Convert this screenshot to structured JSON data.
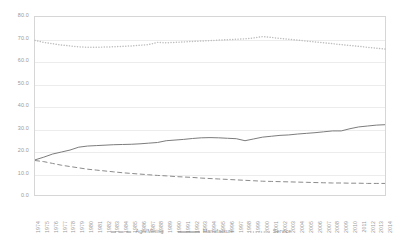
{
  "chart_data": {
    "type": "line",
    "title": "",
    "subtitle": "",
    "xlabel": "",
    "ylabel": "",
    "ylim": [
      0,
      80
    ],
    "ytick_labels": [
      "80.0",
      "70.0",
      "60.0",
      "50.0",
      "40.0",
      "30.0",
      "20.0",
      "10.0",
      "0.0"
    ],
    "ytick_values": [
      80,
      70,
      60,
      50,
      40,
      30,
      20,
      10,
      0
    ],
    "grid": true,
    "legend_position": "bottom",
    "categories": [
      "1974",
      "1975",
      "1976",
      "1977",
      "1978",
      "1979",
      "1980",
      "1981",
      "1982",
      "1983",
      "1984",
      "1985",
      "1986",
      "1987",
      "1988",
      "1989",
      "1990",
      "1991",
      "1992",
      "1993",
      "1994",
      "1995",
      "1996",
      "1997",
      "1998",
      "1999",
      "2000",
      "2001",
      "2002",
      "2003",
      "2004",
      "2005",
      "2006",
      "2007",
      "2008",
      "2009",
      "2010",
      "2011",
      "2012",
      "2013",
      "2014"
    ],
    "series": [
      {
        "name": "Agri/Mining",
        "style": "dashed",
        "color": "#8a8a8a",
        "values": [
          15.5,
          15.0,
          14.2,
          13.4,
          12.8,
          12.2,
          11.6,
          11.2,
          10.8,
          10.4,
          10.0,
          9.7,
          9.4,
          9.1,
          8.8,
          8.6,
          8.3,
          8.1,
          7.9,
          7.6,
          7.4,
          7.2,
          7.0,
          6.8,
          6.6,
          6.4,
          6.2,
          6.1,
          6.0,
          5.9,
          5.8,
          5.7,
          5.6,
          5.5,
          5.4,
          5.4,
          5.3,
          5.3,
          5.2,
          5.2,
          5.2
        ]
      },
      {
        "name": "Manufacture",
        "style": "solid",
        "color": "#7a7a7a",
        "values": [
          15.8,
          17.0,
          18.4,
          19.3,
          20.2,
          21.5,
          22.0,
          22.2,
          22.4,
          22.6,
          22.7,
          22.8,
          23.0,
          23.3,
          23.6,
          24.4,
          24.7,
          25.0,
          25.4,
          25.7,
          25.8,
          25.7,
          25.5,
          25.3,
          24.4,
          25.2,
          26.0,
          26.4,
          26.8,
          27.0,
          27.4,
          27.7,
          28.0,
          28.4,
          28.8,
          28.8,
          29.8,
          30.6,
          31.0,
          31.4,
          31.6
        ]
      },
      {
        "name": "Service",
        "style": "dotted",
        "color": "#bdbdbd",
        "values": [
          69.5,
          68.6,
          68.0,
          67.4,
          67.0,
          66.6,
          66.4,
          66.4,
          66.5,
          66.6,
          66.8,
          67.0,
          67.3,
          67.6,
          68.6,
          68.4,
          68.6,
          68.8,
          69.0,
          69.2,
          69.4,
          69.6,
          69.8,
          70.0,
          70.2,
          70.6,
          71.2,
          70.8,
          70.4,
          70.0,
          69.6,
          69.2,
          68.8,
          68.4,
          68.0,
          67.6,
          67.2,
          66.8,
          66.4,
          66.0,
          65.6
        ]
      }
    ]
  }
}
